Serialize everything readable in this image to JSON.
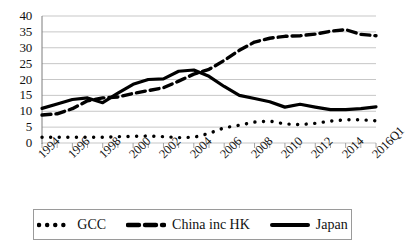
{
  "chart_data": {
    "type": "line",
    "title": "",
    "xlabel": "",
    "ylabel": "",
    "ylim": [
      0,
      40
    ],
    "ytick_values": [
      0,
      5,
      10,
      15,
      20,
      25,
      30,
      35,
      40
    ],
    "grid": true,
    "legend_position": "bottom",
    "x": [
      "1994",
      "1995",
      "1996",
      "1997",
      "1998",
      "1999",
      "2000",
      "2001",
      "2002",
      "2003",
      "2004",
      "2005",
      "2006",
      "2007",
      "2008",
      "2009",
      "2010",
      "2011",
      "2012",
      "2013",
      "2014",
      "2015",
      "2016Q1"
    ],
    "xtick_labels": [
      "1994",
      "1996",
      "1998",
      "2000",
      "2002",
      "2004",
      "2006",
      "2008",
      "2010",
      "2012",
      "2014",
      "2016Q1"
    ],
    "series": [
      {
        "name": "GCC",
        "style": "dotted",
        "color": "#000000",
        "values": [
          1.8,
          1.8,
          1.8,
          1.8,
          1.8,
          2.0,
          2.1,
          2.2,
          2.0,
          1.7,
          1.8,
          3.0,
          4.8,
          5.6,
          6.6,
          6.9,
          6.0,
          5.8,
          6.2,
          6.9,
          7.3,
          7.3,
          7.0
        ]
      },
      {
        "name": "China inc HK",
        "style": "dashed",
        "color": "#000000",
        "values": [
          8.8,
          9.2,
          10.8,
          13.3,
          14.2,
          14.5,
          15.6,
          16.5,
          17.4,
          19.5,
          21.7,
          23.2,
          26.0,
          29.2,
          31.8,
          33.0,
          33.6,
          33.8,
          34.3,
          35.2,
          35.7,
          34.2,
          33.8
        ]
      },
      {
        "name": "Japan",
        "style": "solid",
        "color": "#000000",
        "values": [
          10.9,
          12.3,
          13.7,
          14.2,
          12.7,
          15.7,
          18.5,
          20.0,
          20.2,
          22.6,
          23.0,
          21.0,
          17.8,
          15.0,
          14.0,
          13.0,
          11.3,
          12.2,
          11.3,
          10.5,
          10.5,
          10.8,
          11.4
        ]
      }
    ]
  },
  "legend": {
    "items": [
      {
        "label": "GCC",
        "style": "dotted"
      },
      {
        "label": "China inc HK",
        "style": "dashed"
      },
      {
        "label": "Japan",
        "style": "solid"
      }
    ]
  }
}
